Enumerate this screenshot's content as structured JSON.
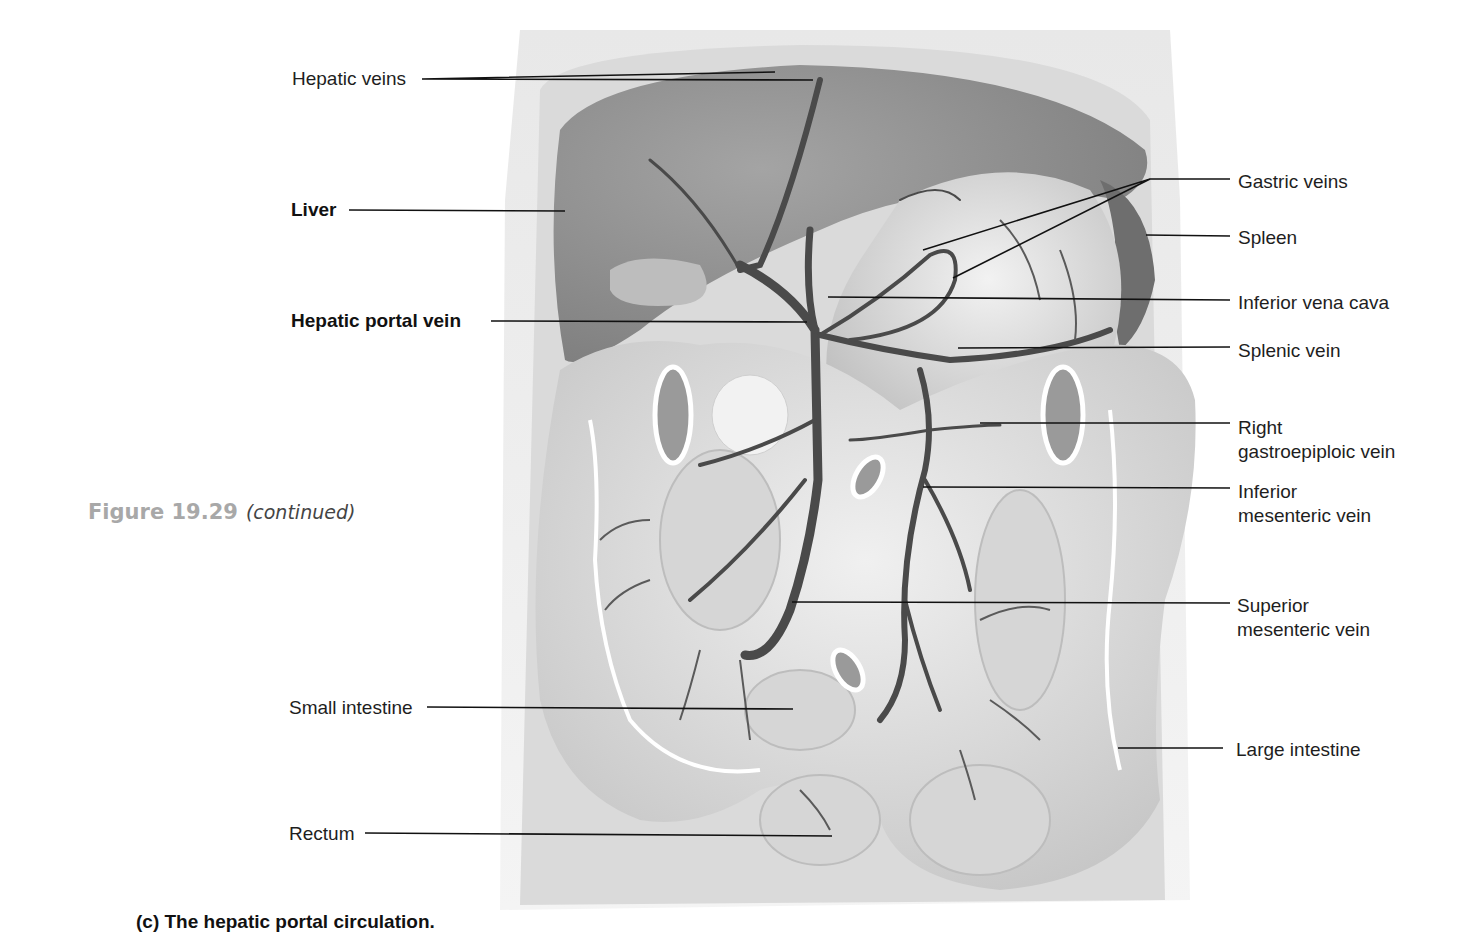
{
  "figure": {
    "number": "Figure 19.29",
    "note": "(continued)",
    "caption": "(c) The hepatic portal circulation."
  },
  "labels": {
    "left": [
      {
        "id": "hepatic-veins",
        "text": "Hepatic veins",
        "bold": false
      },
      {
        "id": "liver",
        "text": "Liver",
        "bold": true
      },
      {
        "id": "hepatic-portal-vein",
        "text": "Hepatic portal vein",
        "bold": true
      },
      {
        "id": "small-intestine",
        "text": "Small intestine",
        "bold": false
      },
      {
        "id": "rectum",
        "text": "Rectum",
        "bold": false
      }
    ],
    "right": [
      {
        "id": "gastric-veins",
        "text": "Gastric veins"
      },
      {
        "id": "spleen",
        "text": "Spleen"
      },
      {
        "id": "inferior-vena-cava",
        "text": "Inferior vena cava"
      },
      {
        "id": "splenic-vein",
        "text": "Splenic vein"
      },
      {
        "id": "right-gastroepiploic-vein",
        "line1": "Right",
        "line2": "gastroepiploic vein"
      },
      {
        "id": "inferior-mesenteric-vein",
        "line1": "Inferior",
        "line2": "mesenteric vein"
      },
      {
        "id": "superior-mesenteric-vein",
        "line1": "Superior",
        "line2": "mesenteric vein"
      },
      {
        "id": "large-intestine",
        "text": "Large intestine"
      }
    ]
  },
  "colors": {
    "background": "#ffffff",
    "vein": "#4a4a4a",
    "organ_dark": "#8c8c8c",
    "organ_mid": "#b4b4b4",
    "organ_light": "#dcdcdc",
    "figure_number": "#a8a8a8"
  }
}
